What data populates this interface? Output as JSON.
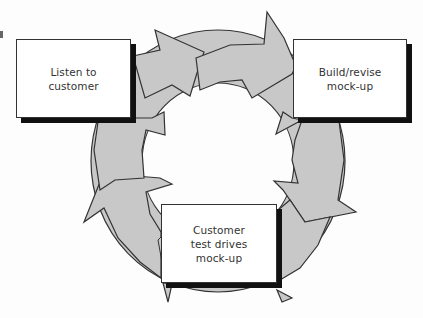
{
  "diagram": {
    "type": "cycle",
    "steps": [
      {
        "id": "listen",
        "label": "Listen to\ncustomer"
      },
      {
        "id": "build",
        "label": "Build/revise\nmock-up"
      },
      {
        "id": "test",
        "label": "Customer\ntest drives\nmock-up"
      }
    ],
    "colors": {
      "arrow_fill": "#c8c8c8",
      "arrow_stroke": "#333333",
      "box_fill": "#ffffff",
      "box_shadow": "#111111",
      "background": "#fdfdfd"
    }
  }
}
